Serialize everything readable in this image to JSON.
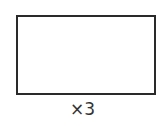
{
  "diagram": {
    "shape": "rectangle",
    "stroke_color": "#2a2a2a",
    "fill_color": "#ffffff",
    "multiplier_label": "×3"
  }
}
